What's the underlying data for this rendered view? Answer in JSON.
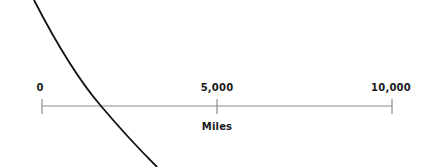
{
  "scale_bar": {
    "unit": "Miles",
    "ticks": [
      {
        "label": "0",
        "value": 0
      },
      {
        "label": "5,000",
        "value": 5000
      },
      {
        "label": "10,000",
        "value": 10000
      }
    ],
    "line_color": "#8c8c8c",
    "tick_color": "#8c8c8c"
  },
  "boundary_curve": {
    "color": "#111111",
    "description": "curved line (meridian/boundary arc)"
  }
}
